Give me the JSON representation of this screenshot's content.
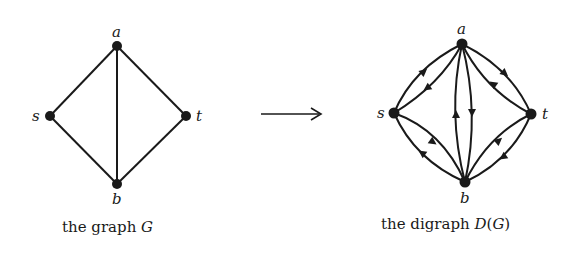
{
  "left_graph": {
    "caption_prefix": "the graph ",
    "caption_symbol": "G",
    "nodes": {
      "a": {
        "label": "a"
      },
      "s": {
        "label": "s"
      },
      "t": {
        "label": "t"
      },
      "b": {
        "label": "b"
      }
    },
    "edges": [
      [
        "s",
        "a"
      ],
      [
        "a",
        "t"
      ],
      [
        "s",
        "b"
      ],
      [
        "b",
        "t"
      ],
      [
        "a",
        "b"
      ]
    ]
  },
  "transform_arrow": {
    "symbol": "→"
  },
  "right_graph": {
    "caption_prefix": "the digraph ",
    "caption_symbol": "D",
    "caption_paren_open": "(",
    "caption_arg": "G",
    "caption_paren_close": ")",
    "nodes": {
      "a": {
        "label": "a"
      },
      "s": {
        "label": "s"
      },
      "t": {
        "label": "t"
      },
      "b": {
        "label": "b"
      }
    },
    "arcs": [
      [
        "s",
        "a"
      ],
      [
        "a",
        "s"
      ],
      [
        "a",
        "t"
      ],
      [
        "t",
        "a"
      ],
      [
        "b",
        "a"
      ],
      [
        "a",
        "b"
      ],
      [
        "s",
        "b"
      ],
      [
        "b",
        "s"
      ],
      [
        "b",
        "t"
      ],
      [
        "t",
        "b"
      ]
    ]
  },
  "colors": {
    "ink": "#1a1a1a",
    "background": "#ffffff"
  }
}
